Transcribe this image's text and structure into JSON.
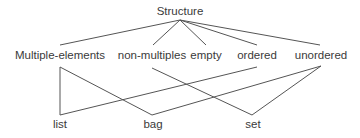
{
  "diagram": {
    "root": {
      "id": "structure",
      "label": "Structure"
    },
    "categories": [
      {
        "id": "multiple-elements",
        "label": "Multiple-elements"
      },
      {
        "id": "non-multiples",
        "label": "non-multiples"
      },
      {
        "id": "empty",
        "label": "empty"
      },
      {
        "id": "ordered",
        "label": "ordered"
      },
      {
        "id": "unordered",
        "label": "unordered"
      }
    ],
    "leaves": [
      {
        "id": "list",
        "label": "list"
      },
      {
        "id": "bag",
        "label": "bag"
      },
      {
        "id": "set",
        "label": "set"
      }
    ],
    "edges": [
      {
        "from": "structure",
        "to": "multiple-elements"
      },
      {
        "from": "structure",
        "to": "non-multiples"
      },
      {
        "from": "structure",
        "to": "empty"
      },
      {
        "from": "structure",
        "to": "ordered"
      },
      {
        "from": "structure",
        "to": "unordered"
      },
      {
        "from": "multiple-elements",
        "to": "list"
      },
      {
        "from": "ordered",
        "to": "list"
      },
      {
        "from": "multiple-elements",
        "to": "bag"
      },
      {
        "from": "unordered",
        "to": "bag"
      },
      {
        "from": "non-multiples",
        "to": "set"
      },
      {
        "from": "unordered",
        "to": "set"
      }
    ],
    "line_color": "#555555",
    "text_color": "#3a3a3a"
  }
}
